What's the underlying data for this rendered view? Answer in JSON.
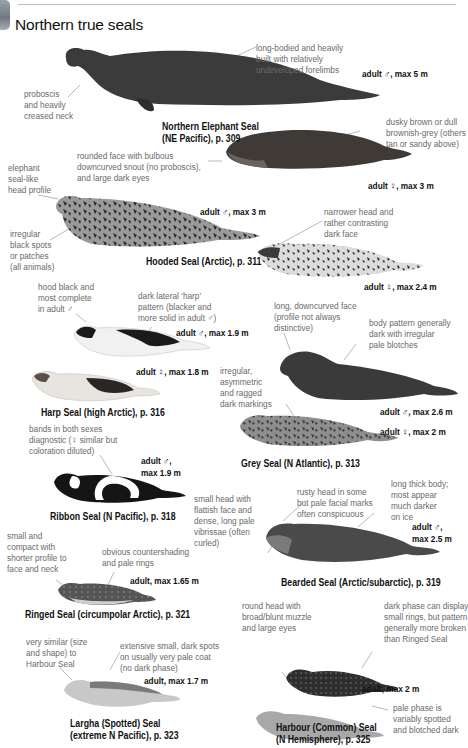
{
  "page": {
    "section_title": "Northern true seals"
  },
  "species": [
    {
      "id": "northern-elephant-seal",
      "caption_line1": "Northern Elephant Seal",
      "caption_line2": "(NE Pacific), p. 309",
      "sizes": [
        "adult ♂, max 5 m",
        "adult ♀, max 3 m"
      ],
      "notes": [
        "proboscis\nand heavily\ncreased neck",
        "long-bodied and heavily\nbuilt with relatively\nundeveloped forelimbs",
        "dusky brown or dull\nbrownish-grey (others\ntan or sandy above)",
        "rounded face with bulbous\ndowncurved snout (no proboscis),\nand large dark eyes"
      ]
    },
    {
      "id": "hooded-seal",
      "caption_line1": "Hooded Seal (Arctic), p. 311",
      "sizes": [
        "adult ♂, max 3 m",
        "adult ♀, max 2.4 m"
      ],
      "notes": [
        "elephant\nseal-like\nhead profile",
        "irregular\nblack spots\nor patches\n(all animals)",
        "narrower head and\nrather contrasting\ndark face"
      ]
    },
    {
      "id": "harp-seal",
      "caption_line1": "Harp Seal (high Arctic), p. 316",
      "sizes": [
        "adult ♂, max 1.9 m",
        "adult ♀, max 1.8 m"
      ],
      "notes": [
        "hood black and\nmost complete\nin adult ♂",
        "dark lateral ‘harp’\npattern (blacker and\nmore solid in adult ♂)"
      ]
    },
    {
      "id": "grey-seal",
      "caption_line1": "Grey Seal (N Atlantic), p. 313",
      "sizes": [
        "adult ♂, max 2.6 m",
        "adult ♀, max 2 m"
      ],
      "notes": [
        "long, downcurved face\n(profile not always\ndistinctive)",
        "body pattern generally\ndark with irregular\npale blotches",
        "irregular,\nasymmetric\nand ragged\ndark markings"
      ]
    },
    {
      "id": "ribbon-seal",
      "caption_line1": "Ribbon Seal (N Pacific), p. 318",
      "sizes": [
        "adult ♂,\nmax 1.9 m"
      ],
      "notes": [
        "bands in both sexes\ndiagnostic (♀ similar but\ncoloration diluted)"
      ]
    },
    {
      "id": "bearded-seal",
      "caption_line1": "Bearded Seal (Arctic/subarctic), p. 319",
      "sizes": [
        "adult ♂,\nmax 2.5 m"
      ],
      "notes": [
        "small head with\nflattish face and\ndense, long pale\nvibrissae (often\ncurled)",
        "rusty head in some\nbut pale facial marks\noften conspicuous",
        "long thick body;\nmost appear\nmuch darker\non ice"
      ]
    },
    {
      "id": "ringed-seal",
      "caption_line1": "Ringed Seal (circumpolar Arctic), p. 321",
      "sizes": [
        "adult, max 1.65 m"
      ],
      "notes": [
        "small and\ncompact with\nshorter profile to\nface and neck",
        "obvious countershading\nand pale rings"
      ]
    },
    {
      "id": "largha-seal",
      "caption_line1": "Largha (Spotted) Seal",
      "caption_line2": "(extreme N Pacific), p. 323",
      "sizes": [
        "adult, max 1.7 m"
      ],
      "notes": [
        "very similar (size\nand shape) to\nHarbour Seal",
        "extensive small, dark spots\non usually very pale coat\n(no dark phase)"
      ]
    },
    {
      "id": "harbour-seal",
      "caption_line1": "Harbour (Common) Seal",
      "caption_line2": "(N Hemisphere), p. 325",
      "sizes": [
        "adult, max 2 m"
      ],
      "notes": [
        "round head with\nbroad/blunt muzzle\nand large eyes",
        "dark phase can display\nsmall rings, but pattern\ngenerally more broken\nthan Ringed Seal",
        "pale phase is\nvariably spotted\nand blotched dark"
      ]
    }
  ]
}
